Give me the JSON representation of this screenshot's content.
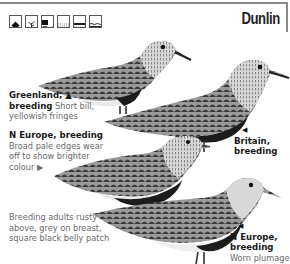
{
  "header": {
    "title": "Dunlin",
    "habitat_icons": [
      "house-icon",
      "tree-icon",
      "coast-icon",
      "marsh-icon",
      "mudflat-icon",
      "sea-icon"
    ]
  },
  "captions": [
    {
      "id": "greenland",
      "heading": "Greenland, ▲",
      "heading2": "breeding",
      "text1": " Short bill,",
      "text2": "yellowish fringes"
    },
    {
      "id": "n-europe-1",
      "heading": "N Europe, breeding",
      "lines": [
        "Broad pale edges wear",
        "off to show brighter",
        "colour ▶"
      ]
    },
    {
      "id": "britain",
      "arrow": "◀",
      "heading": "Britain,",
      "heading2": "breeding"
    },
    {
      "id": "general",
      "lines": [
        "Breeding adults rusty",
        "above, grey on breast,",
        "square black belly patch"
      ]
    },
    {
      "id": "n-europe-2",
      "arrow": "◀",
      "heading": "N Europe,",
      "heading2": "breeding",
      "text": "Worn plumage"
    }
  ],
  "colors": {
    "border": "#8a8a8a",
    "text_dark": "#1a1a1a",
    "text_light": "#6a6a6a",
    "belly": "#1c1c1c"
  }
}
